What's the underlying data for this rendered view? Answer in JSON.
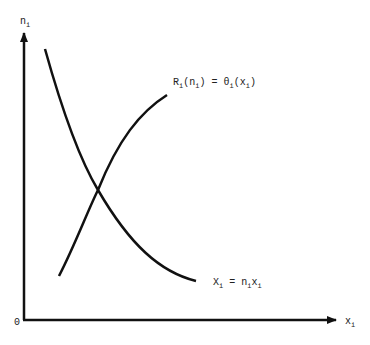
{
  "diagram": {
    "axes": {
      "y_label": "n",
      "y_label_sub": "i",
      "x_label": "x",
      "x_label_sub": "i",
      "origin_label": "0"
    },
    "curves": [
      {
        "name": "revenue-curve",
        "label_parts": [
          "R",
          "i",
          "(n",
          "i",
          ") = θ",
          "i",
          "(x",
          "i",
          ")"
        ],
        "description": "increasing concave curve"
      },
      {
        "name": "output-curve",
        "label_parts": [
          "X",
          "i",
          " = n",
          "i",
          "x",
          "i"
        ],
        "description": "decreasing convex curve (hyperbola)"
      }
    ],
    "colors": {
      "line": "#111111",
      "background": "#ffffff"
    }
  }
}
